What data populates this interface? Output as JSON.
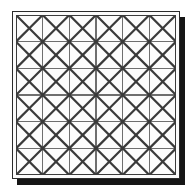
{
  "figure": {
    "title": "Square lattice with full diagonals",
    "description": "A square panel containing a 6 by 6 grid of cells; each cell is crossed by both of its diagonals, producing a pattern of tilted squares (diamonds).",
    "caption": ""
  },
  "panel": {
    "border_color": "#2b2b2b",
    "background_color": "#fbfbfb",
    "shadow_color": "#151515",
    "shadow_offset_px": 5,
    "frame_inset_px": 3
  },
  "chart_data": {
    "type": "diagram",
    "title": "Square lattice with full diagonals",
    "grid": {
      "columns": 6,
      "rows": 6,
      "x_divisions": [
        0,
        1,
        2,
        3,
        4,
        5,
        6
      ],
      "y_divisions": [
        0,
        1,
        2,
        3,
        4,
        5,
        6
      ],
      "line_color": "#6e6e6e",
      "line_width": 1.1,
      "grid_on": true
    },
    "diagonals": {
      "per_cell": 2,
      "directions": [
        "down-right",
        "down-left"
      ],
      "line_color": "#3a3a3a",
      "line_width": 2.2,
      "total_count": 72
    },
    "xlabel": "",
    "ylabel": "",
    "legend": [],
    "annotations": []
  },
  "legend": {
    "entries": [
      {
        "name": "grid-line",
        "label": "Grid line",
        "color": "#6e6e6e"
      },
      {
        "name": "diagonal-line",
        "label": "Cell diagonal",
        "color": "#3a3a3a"
      }
    ]
  }
}
